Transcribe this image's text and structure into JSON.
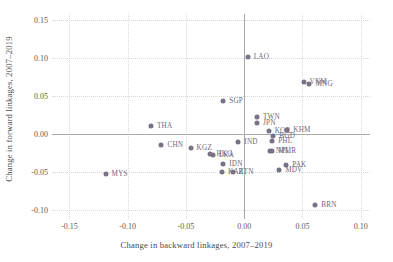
{
  "chart_data": {
    "type": "scatter",
    "title": "",
    "xlabel": "Change in backward linkages, 2007–2019",
    "ylabel": "Change in forward linkages, 2007–2019",
    "xlim": [
      -0.165,
      0.108
    ],
    "ylim": [
      -0.112,
      0.158
    ],
    "xticks": [
      -0.15,
      -0.1,
      -0.05,
      0.0,
      0.05,
      0.1
    ],
    "xticklabels": [
      "-0.15",
      "-0.10",
      "-0.05",
      "0.00",
      "0.05",
      "0.10"
    ],
    "yticks": [
      -0.1,
      -0.05,
      0.0,
      0.05,
      0.1,
      0.15
    ],
    "yticklabels": [
      "-0.10",
      "-0.05",
      "0.00",
      "0.05",
      "0.10",
      "0.15"
    ],
    "grid": true,
    "legend": "none",
    "marker_color": "#7a7184",
    "zero_line_color": "#a9a9a9",
    "points": [
      {
        "label": "LAO",
        "x": 0.003,
        "y": 0.101,
        "lx": 6,
        "ly": -3
      },
      {
        "label": "VNM",
        "x": 0.051,
        "y": 0.069,
        "lx": 6,
        "ly": -3
      },
      {
        "label": "MNG",
        "x": 0.056,
        "y": 0.066,
        "lx": 6,
        "ly": -3
      },
      {
        "label": "SGP",
        "x": -0.018,
        "y": 0.044,
        "lx": 6,
        "ly": -3
      },
      {
        "label": "TWN",
        "x": 0.011,
        "y": 0.023,
        "lx": 6,
        "ly": -3
      },
      {
        "label": "JPN",
        "x": 0.011,
        "y": 0.015,
        "lx": 6,
        "ly": -3
      },
      {
        "label": "KOR",
        "x": 0.021,
        "y": 0.004,
        "lx": 6,
        "ly": -3
      },
      {
        "label": "KHM",
        "x": 0.037,
        "y": 0.005,
        "lx": 6,
        "ly": -3
      },
      {
        "label": "THA",
        "x": -0.08,
        "y": 0.011,
        "lx": 6,
        "ly": -3
      },
      {
        "label": "BGD",
        "x": 0.025,
        "y": -0.003,
        "lx": 6,
        "ly": -3
      },
      {
        "label": "PHL",
        "x": 0.024,
        "y": -0.009,
        "lx": 6,
        "ly": -3
      },
      {
        "label": "IND",
        "x": -0.005,
        "y": -0.01,
        "lx": 6,
        "ly": -3
      },
      {
        "label": "CHN",
        "x": -0.071,
        "y": -0.014,
        "lx": 6,
        "ly": -3
      },
      {
        "label": "KGZ",
        "x": -0.046,
        "y": -0.019,
        "lx": 6,
        "ly": -3
      },
      {
        "label": "NPL",
        "x": 0.022,
        "y": -0.022,
        "lx": 6,
        "ly": -3
      },
      {
        "label": "MMR",
        "x": 0.024,
        "y": -0.023,
        "lx": 6,
        "ly": -3
      },
      {
        "label": "HKG",
        "x": -0.029,
        "y": -0.027,
        "lx": 6,
        "ly": -3
      },
      {
        "label": "LKA",
        "x": -0.027,
        "y": -0.028,
        "lx": 6,
        "ly": -3
      },
      {
        "label": "IDN",
        "x": -0.018,
        "y": -0.04,
        "lx": 6,
        "ly": -3
      },
      {
        "label": "PAK",
        "x": 0.036,
        "y": -0.041,
        "lx": 6,
        "ly": -3
      },
      {
        "label": "MDV",
        "x": 0.03,
        "y": -0.047,
        "lx": 6,
        "ly": -3
      },
      {
        "label": "KAZ",
        "x": -0.019,
        "y": -0.05,
        "lx": 6,
        "ly": -3
      },
      {
        "label": "BTN",
        "x": -0.01,
        "y": -0.05,
        "lx": 6,
        "ly": -3
      },
      {
        "label": "MYS",
        "x": -0.119,
        "y": -0.053,
        "lx": 6,
        "ly": -3
      },
      {
        "label": "BRN",
        "x": 0.061,
        "y": -0.093,
        "lx": 6,
        "ly": -3
      }
    ]
  }
}
